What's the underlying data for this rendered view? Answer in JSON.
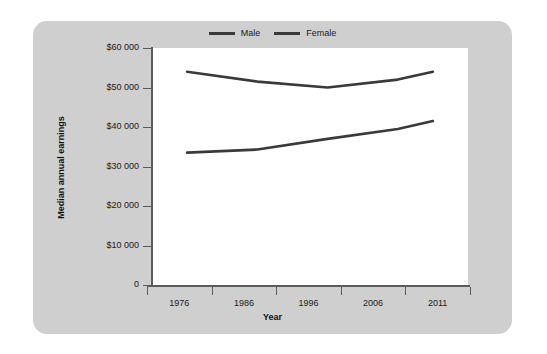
{
  "chart_data": {
    "type": "line",
    "title": "",
    "subtitle": "",
    "xlabel": "Year",
    "ylabel": "Median annual earnings",
    "x": [
      1976,
      1986,
      1996,
      2006,
      2011
    ],
    "xlim": [
      1971,
      2016
    ],
    "ylim": [
      0,
      60000
    ],
    "grid": false,
    "legend_position": "top-center",
    "xtick_labels": [
      "1976",
      "1986",
      "1996",
      "2006",
      "2011"
    ],
    "ytick_labels": [
      "0",
      "$10 000",
      "$20 000",
      "$30 000",
      "$40 000",
      "$50 000",
      "$60 000"
    ],
    "ytick_values": [
      0,
      10000,
      20000,
      30000,
      40000,
      50000,
      60000
    ],
    "series": [
      {
        "name": "Male",
        "color": "#3a3a3a",
        "values": [
          54000,
          51500,
          50000,
          52000,
          54000
        ]
      },
      {
        "name": "Female",
        "color": "#3a3a3a",
        "values": [
          33500,
          34300,
          37000,
          39500,
          41500
        ]
      }
    ],
    "annotations": []
  },
  "legend": {
    "entries": [
      {
        "label": "Male"
      },
      {
        "label": "Female"
      }
    ]
  },
  "axes": {
    "x_title": "Year",
    "y_title": "Median annual earnings"
  },
  "colors": {
    "panel_background": "#cfcfcf",
    "plot_background": "#ffffff",
    "line": "#3a3a3a",
    "axis": "#5b5b5b",
    "text": "#1a1a1a"
  }
}
